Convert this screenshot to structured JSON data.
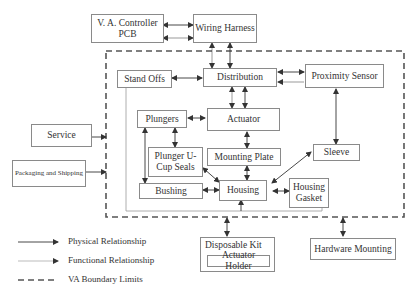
{
  "diagram": {
    "nodes": {
      "va_controller": "V. A. Controller PCB",
      "wiring_harness": "Wiring Harness",
      "stand_offs": "Stand Offs",
      "distribution": "Distribution",
      "proximity_sensor": "Proximity Sensor",
      "plungers": "Plungers",
      "actuator": "Actuator",
      "plunger_ucup": "Plunger U-Cup Seals",
      "mounting_plate": "Mounting Plate",
      "sleeve": "Sleeve",
      "bushing": "Bushing",
      "housing": "Housing",
      "housing_gasket": "Housing Gasket",
      "service": "Service",
      "packaging": "Packaging and Shipping",
      "disposable_kit": "Disposable Kit",
      "actuator_holder": "Actuator Holder",
      "hardware_mounting": "Hardware Mounting"
    },
    "legend": {
      "physical": "Physical Relationship",
      "functional": "Functional  Relationship",
      "boundary": "VA Boundary Limits"
    },
    "colors": {
      "line": "#333333",
      "box_border": "#8a8a8a",
      "boundary": "#555555"
    }
  }
}
